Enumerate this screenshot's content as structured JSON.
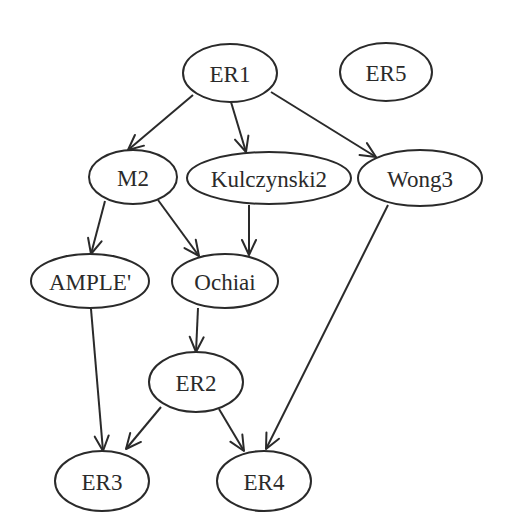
{
  "diagram": {
    "type": "directed-graph",
    "colors": {
      "stroke": "#2a2a2a",
      "node_fill": "#ffffff",
      "background": "#ffffff",
      "text": "#2a2a2a"
    },
    "nodes": [
      {
        "id": "ER1",
        "label": "ER1",
        "cx": 230,
        "cy": 73,
        "rx": 47,
        "ry": 29
      },
      {
        "id": "ER5",
        "label": "ER5",
        "cx": 386,
        "cy": 72,
        "rx": 46,
        "ry": 29
      },
      {
        "id": "M2",
        "label": "M2",
        "cx": 133,
        "cy": 177,
        "rx": 44,
        "ry": 27
      },
      {
        "id": "Kulczynski2",
        "label": "Kulczynski2",
        "cx": 269,
        "cy": 178,
        "rx": 82,
        "ry": 26
      },
      {
        "id": "Wong3",
        "label": "Wong3",
        "cx": 420,
        "cy": 178,
        "rx": 62,
        "ry": 28
      },
      {
        "id": "AMPLE",
        "label": "AMPLE'",
        "cx": 90,
        "cy": 281,
        "rx": 59,
        "ry": 27
      },
      {
        "id": "Ochiai",
        "label": "Ochiai",
        "cx": 225,
        "cy": 281,
        "rx": 53,
        "ry": 27
      },
      {
        "id": "ER2",
        "label": "ER2",
        "cx": 196,
        "cy": 382,
        "rx": 47,
        "ry": 30
      },
      {
        "id": "ER3",
        "label": "ER3",
        "cx": 102,
        "cy": 481,
        "rx": 47,
        "ry": 30
      },
      {
        "id": "ER4",
        "label": "ER4",
        "cx": 264,
        "cy": 481,
        "rx": 47,
        "ry": 30
      }
    ],
    "edges": [
      {
        "from": "ER1",
        "to": "M2",
        "x1": 193,
        "y1": 95,
        "x2": 128,
        "y2": 150
      },
      {
        "from": "ER1",
        "to": "Kulczynski2",
        "x1": 231,
        "y1": 102,
        "x2": 246,
        "y2": 152
      },
      {
        "from": "ER1",
        "to": "Wong3",
        "x1": 271,
        "y1": 92,
        "x2": 376,
        "y2": 157
      },
      {
        "from": "M2",
        "to": "AMPLE",
        "x1": 105,
        "y1": 201,
        "x2": 91,
        "y2": 254
      },
      {
        "from": "M2",
        "to": "Ochiai",
        "x1": 158,
        "y1": 200,
        "x2": 199,
        "y2": 256
      },
      {
        "from": "Kulczynski2",
        "to": "Ochiai",
        "x1": 249,
        "y1": 205,
        "x2": 249,
        "y2": 255
      },
      {
        "from": "Wong3",
        "to": "ER4",
        "x1": 388,
        "y1": 205,
        "x2": 266,
        "y2": 449
      },
      {
        "from": "AMPLE",
        "to": "ER3",
        "x1": 91,
        "y1": 309,
        "x2": 103,
        "y2": 451
      },
      {
        "from": "Ochiai",
        "to": "ER2",
        "x1": 198,
        "y1": 308,
        "x2": 196,
        "y2": 352
      },
      {
        "from": "ER2",
        "to": "ER3",
        "x1": 161,
        "y1": 407,
        "x2": 126,
        "y2": 449
      },
      {
        "from": "ER2",
        "to": "ER4",
        "x1": 219,
        "y1": 409,
        "x2": 244,
        "y2": 451
      }
    ]
  }
}
